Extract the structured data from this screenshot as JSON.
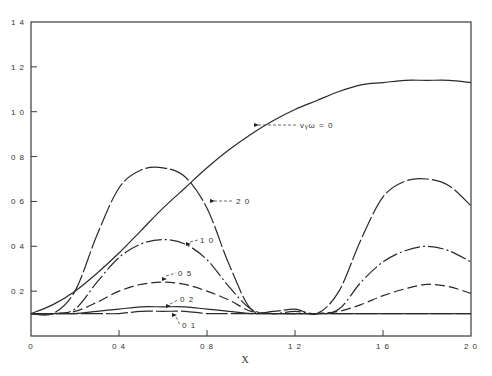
{
  "chart_data": {
    "type": "line",
    "title": "",
    "xlabel": "X",
    "ylabel": "",
    "xlim": [
      0,
      2.0
    ],
    "ylim": [
      0,
      1.4
    ],
    "grid": false,
    "legend_position": "inline labels",
    "x_ticks": [
      "0",
      "0.4",
      "0.8",
      "1.2",
      "1.6",
      "2.0"
    ],
    "y_ticks": [
      "0.2",
      "0.4",
      "0.6",
      "0.8",
      "1.0",
      "1.2",
      "1.4"
    ],
    "x": [
      0,
      0.1,
      0.2,
      0.3,
      0.4,
      0.5,
      0.6,
      0.7,
      0.8,
      0.9,
      1.0,
      1.1,
      1.2,
      1.3,
      1.4,
      1.5,
      1.6,
      1.7,
      1.8,
      1.9,
      2.0
    ],
    "series": [
      {
        "name": "v_yω = 0",
        "label": "vᵧω = 0",
        "style": "solid",
        "values": [
          0.1,
          0.14,
          0.2,
          0.28,
          0.37,
          0.47,
          0.57,
          0.66,
          0.75,
          0.83,
          0.9,
          0.96,
          1.01,
          1.05,
          1.09,
          1.12,
          1.13,
          1.14,
          1.14,
          1.14,
          1.13
        ]
      },
      {
        "name": "2.0",
        "label": "2.0",
        "style": "long-dash",
        "values": [
          0.1,
          0.1,
          0.2,
          0.45,
          0.66,
          0.74,
          0.75,
          0.71,
          0.57,
          0.32,
          0.12,
          0.11,
          0.12,
          0.1,
          0.2,
          0.43,
          0.62,
          0.69,
          0.7,
          0.67,
          0.58
        ]
      },
      {
        "name": "1.0",
        "label": "1.0",
        "style": "dash-dot",
        "values": [
          0.1,
          0.1,
          0.12,
          0.24,
          0.35,
          0.41,
          0.43,
          0.41,
          0.34,
          0.22,
          0.12,
          0.1,
          0.11,
          0.1,
          0.12,
          0.24,
          0.33,
          0.38,
          0.4,
          0.38,
          0.33
        ]
      },
      {
        "name": "0.5",
        "label": "0.5",
        "style": "dash",
        "values": [
          0.1,
          0.1,
          0.11,
          0.15,
          0.2,
          0.23,
          0.24,
          0.23,
          0.2,
          0.16,
          0.11,
          0.1,
          0.1,
          0.1,
          0.11,
          0.14,
          0.18,
          0.21,
          0.23,
          0.22,
          0.19
        ]
      },
      {
        "name": "0.2",
        "label": "0.2",
        "style": "solid",
        "values": [
          0.1,
          0.1,
          0.1,
          0.11,
          0.12,
          0.13,
          0.13,
          0.13,
          0.12,
          0.11,
          0.1,
          0.1,
          0.1,
          0.1,
          0.1,
          0.1,
          0.1,
          0.1,
          0.1,
          0.1,
          0.1
        ]
      },
      {
        "name": "0.1",
        "label": "0.1",
        "style": "long-dash",
        "values": [
          0.1,
          0.1,
          0.1,
          0.1,
          0.1,
          0.11,
          0.11,
          0.11,
          0.1,
          0.1,
          0.1,
          0.1,
          0.1,
          0.1,
          0.1,
          0.1,
          0.1,
          0.1,
          0.1,
          0.1,
          0.1
        ]
      }
    ],
    "annotations": [
      "v_yω = 0",
      "2.0",
      "1.0",
      "0.5",
      "0.2",
      "0.1"
    ]
  },
  "colors": {
    "line": "#2a2a2a",
    "axis": "#3a3a3a",
    "background": "#ffffff"
  }
}
